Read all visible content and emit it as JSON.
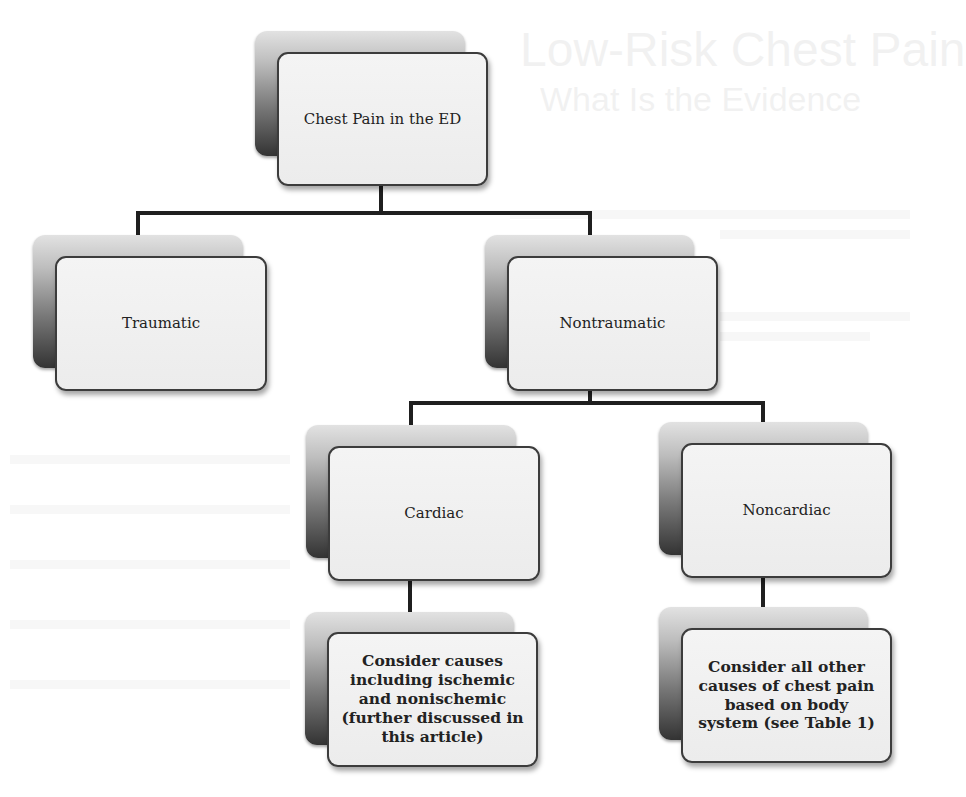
{
  "diagram": {
    "type": "flowchart-tree",
    "background_text": {
      "title": "Low-Risk Chest Pain",
      "subtitle": "What Is the Evidence"
    },
    "colors": {
      "connector": "#1f1f1f",
      "box_fill": "#efefef",
      "box_border": "#3c3c3c",
      "shadow_box_top": "#e2e2e2",
      "shadow_box_bottom": "#333333",
      "text": "#222222"
    },
    "nodes": {
      "root": {
        "label": "Chest Pain in the ED"
      },
      "traumatic": {
        "label": "Traumatic"
      },
      "nontraumatic": {
        "label": "Nontraumatic"
      },
      "cardiac": {
        "label": "Cardiac"
      },
      "noncardiac": {
        "label": "Noncardiac"
      },
      "cardiac_causes": {
        "label": "Consider causes including ischemic and nonischemic (further discussed in this article)"
      },
      "noncardiac_causes": {
        "label": "Consider all other causes of chest pain based on body system (see Table 1)"
      }
    },
    "edges": [
      {
        "from": "Chest Pain in the ED",
        "to": "Traumatic"
      },
      {
        "from": "Chest Pain in the ED",
        "to": "Nontraumatic"
      },
      {
        "from": "Nontraumatic",
        "to": "Cardiac"
      },
      {
        "from": "Nontraumatic",
        "to": "Noncardiac"
      },
      {
        "from": "Cardiac",
        "to": "Consider causes including ischemic and nonischemic (further discussed in this article)"
      },
      {
        "from": "Noncardiac",
        "to": "Consider all other causes of chest pain based on body system (see Table 1)"
      }
    ]
  }
}
